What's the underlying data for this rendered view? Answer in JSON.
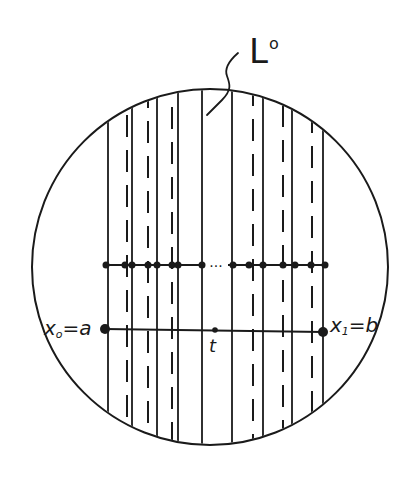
{
  "figure": {
    "colors": {
      "ink": "#1a1a1a",
      "background": "#ffffff"
    },
    "circle": {
      "cx": 210,
      "cy": 267,
      "r": 178
    },
    "leaf_label": {
      "base": "L",
      "sup": "o"
    },
    "leader_curve": "M238,53 C230,60 224,68 227,76 C230,84 232,90 222,100 L207,115",
    "vertical_lines": [
      {
        "x": 108,
        "style": "solid"
      },
      {
        "x": 127,
        "style": "dashed"
      },
      {
        "x": 132,
        "style": "solid"
      },
      {
        "x": 148,
        "style": "dashed"
      },
      {
        "x": 157,
        "style": "solid"
      },
      {
        "x": 172,
        "style": "dashed"
      },
      {
        "x": 178,
        "style": "solid"
      },
      {
        "x": 202,
        "style": "solid"
      },
      {
        "x": 232,
        "style": "solid"
      },
      {
        "x": 253,
        "style": "dashed"
      },
      {
        "x": 263,
        "style": "solid"
      },
      {
        "x": 283,
        "style": "dashed"
      },
      {
        "x": 292,
        "style": "solid"
      },
      {
        "x": 312,
        "style": "dashed"
      },
      {
        "x": 323,
        "style": "solid"
      }
    ],
    "upper_transversal": {
      "y": 265,
      "x_start": 106,
      "x_end": 325,
      "ellipsis": "...",
      "ellipsis_x": 216,
      "dots_x": [
        106,
        125,
        132,
        148,
        157,
        172,
        178,
        202,
        233,
        249,
        263,
        283,
        295,
        311,
        325
      ]
    },
    "lower_transversal": {
      "x_start": 105,
      "y_start": 329,
      "x_end": 323,
      "y_end": 332,
      "endpoint_a": {
        "var": "x",
        "sub": "o",
        "eq": "=a"
      },
      "endpoint_b": {
        "var": "x",
        "sub": "1",
        "eq": "=b"
      },
      "midpoint": {
        "label": "t",
        "x": 215,
        "y": 330
      }
    }
  }
}
